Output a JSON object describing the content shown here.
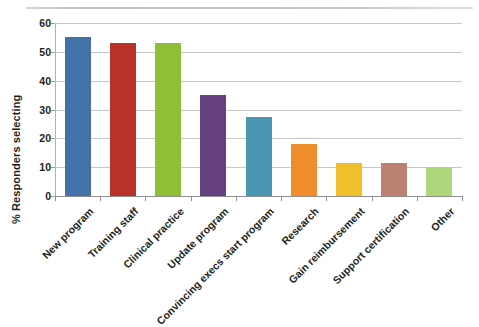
{
  "chart_data": {
    "type": "bar",
    "title": "",
    "subtitle": "",
    "xlabel": "",
    "ylabel": "% Responders selecting",
    "ylim": [
      0,
      60
    ],
    "ytick_values": [
      0,
      10,
      20,
      30,
      40,
      50,
      60
    ],
    "ytick_labels": [
      "0",
      "10",
      "20",
      "30",
      "40",
      "50",
      "60"
    ],
    "grid": "horizontal",
    "legend": "none",
    "categories": [
      "New program",
      "Training staff",
      "Clinical practice",
      "Update program",
      "Convincing execs start program",
      "Research",
      "Gain reimbursement",
      "Support certification",
      "Other"
    ],
    "values": [
      55,
      53,
      53,
      35,
      27.5,
      18,
      11.5,
      11.5,
      10
    ],
    "colors": [
      "#4472a8",
      "#b8322a",
      "#8fbe37",
      "#65417f",
      "#4a97b3",
      "#ef8d2b",
      "#efc02a",
      "#bb8272",
      "#aed островов"
    ],
    "bar_colors": [
      "#4472a8",
      "#b8322a",
      "#8fbe37",
      "#65417f",
      "#4a97b3",
      "#ef8d2b",
      "#efc02a",
      "#bb8272",
      "#aed67a"
    ]
  }
}
